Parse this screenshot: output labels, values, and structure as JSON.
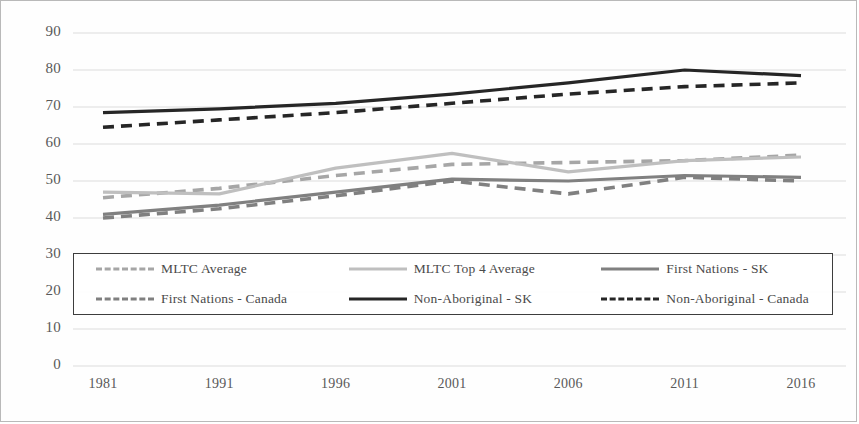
{
  "chart_data": {
    "type": "line",
    "title": "",
    "xlabel": "",
    "ylabel": "",
    "categories": [
      "1981",
      "1991",
      "1996",
      "2001",
      "2006",
      "2011",
      "2016"
    ],
    "ylim": [
      0,
      90
    ],
    "ytick_step": 10,
    "yticks": [
      "90",
      "80",
      "70",
      "60",
      "50",
      "40",
      "30",
      "20",
      "10",
      "0"
    ],
    "grid": true,
    "legend_position": "inside-bottom",
    "series": [
      {
        "name": "MLTC Average",
        "style": "dashed",
        "color": "#a6a6a6",
        "values": [
          45.5,
          48.0,
          51.5,
          54.5,
          55.0,
          55.5,
          57.0
        ]
      },
      {
        "name": "MLTC Top 4 Average",
        "style": "solid",
        "color": "#bfbfbf",
        "values": [
          47.0,
          46.5,
          53.5,
          57.5,
          52.5,
          55.5,
          56.5
        ]
      },
      {
        "name": "First Nations - SK",
        "style": "solid",
        "color": "#808080",
        "values": [
          41.0,
          43.5,
          47.0,
          50.5,
          50.0,
          51.5,
          51.0
        ]
      },
      {
        "name": "First Nations - Canada",
        "style": "dashed",
        "color": "#808080",
        "values": [
          40.0,
          42.5,
          46.0,
          50.0,
          46.5,
          51.0,
          50.0
        ]
      },
      {
        "name": "Non-Aboriginal - SK",
        "style": "solid",
        "color": "#262626",
        "values": [
          68.5,
          69.5,
          71.0,
          73.5,
          76.5,
          80.0,
          78.5
        ]
      },
      {
        "name": "Non-Aboriginal - Canada",
        "style": "dashed",
        "color": "#262626",
        "values": [
          64.5,
          66.5,
          68.5,
          71.0,
          73.5,
          75.5,
          76.5
        ]
      }
    ]
  },
  "legend": {
    "items": [
      {
        "label": "MLTC Average"
      },
      {
        "label": "MLTC Top 4 Average"
      },
      {
        "label": "First Nations - SK"
      },
      {
        "label": "First Nations - Canada"
      },
      {
        "label": "Non-Aboriginal - SK"
      },
      {
        "label": "Non-Aboriginal - Canada"
      }
    ]
  }
}
